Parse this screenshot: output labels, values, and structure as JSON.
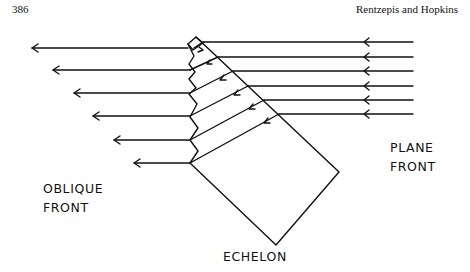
{
  "header": {
    "page_number": "386",
    "running_head": "Rentzepis and Hopkins"
  },
  "figure": {
    "labels": {
      "oblique_front_line1": "OBLIQUE",
      "oblique_front_line2": "FRONT",
      "plane_front_line1": "PLANE",
      "plane_front_line2": "FRONT",
      "echelon": "ECHELON"
    },
    "incoming_rays_count": 6,
    "outgoing_rays_count": 6,
    "line_color": "#111111"
  }
}
